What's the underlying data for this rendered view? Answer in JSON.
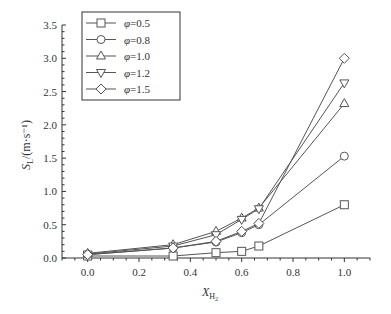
{
  "chart_data": {
    "type": "line",
    "title": "",
    "xlabel": "X_H2",
    "xlabel_main": "X",
    "xlabel_sub": "H",
    "xlabel_subsub": "2",
    "ylabel": "S_L/(m·s⁻¹)",
    "ylabel_main": "S",
    "ylabel_sub": "L",
    "ylabel_unit": "/(m·s⁻¹)",
    "xlim": [
      -0.1,
      1.1
    ],
    "ylim": [
      0.0,
      3.5
    ],
    "xticks": [
      "0.0",
      "0.2",
      "0.4",
      "0.6",
      "0.8",
      "1.0"
    ],
    "yticks": [
      "0.0",
      "0.5",
      "1.0",
      "1.5",
      "2.0",
      "2.5",
      "3.0",
      "3.5"
    ],
    "grid": false,
    "legend_position": "upper left",
    "x": [
      0.0,
      0.333,
      0.5,
      0.6,
      0.667,
      1.0
    ],
    "series": [
      {
        "name": "φ=0.5",
        "marker": "square",
        "values": [
          0.03,
          0.03,
          0.08,
          0.1,
          0.18,
          0.8
        ]
      },
      {
        "name": "φ=0.8",
        "marker": "circle",
        "values": [
          0.05,
          0.15,
          0.24,
          0.38,
          0.5,
          1.53
        ]
      },
      {
        "name": "φ=1.0",
        "marker": "triangle-up",
        "values": [
          0.07,
          0.2,
          0.4,
          0.6,
          0.75,
          2.32
        ]
      },
      {
        "name": "φ=1.2",
        "marker": "triangle-down",
        "values": [
          0.06,
          0.18,
          0.35,
          0.58,
          0.74,
          2.63
        ]
      },
      {
        "name": "φ=1.5",
        "marker": "diamond",
        "values": [
          0.05,
          0.15,
          0.25,
          0.4,
          0.52,
          3.0
        ]
      }
    ]
  },
  "legend": {
    "items": [
      {
        "label": "φ=0.5",
        "marker": "square-icon"
      },
      {
        "label": "φ=0.8",
        "marker": "circle-icon"
      },
      {
        "label": "φ=1.0",
        "marker": "triangle-up-icon"
      },
      {
        "label": "φ=1.2",
        "marker": "triangle-down-icon"
      },
      {
        "label": "φ=1.5",
        "marker": "diamond-icon"
      }
    ]
  },
  "colors": {
    "line": "#555555",
    "axis": "#333333"
  }
}
